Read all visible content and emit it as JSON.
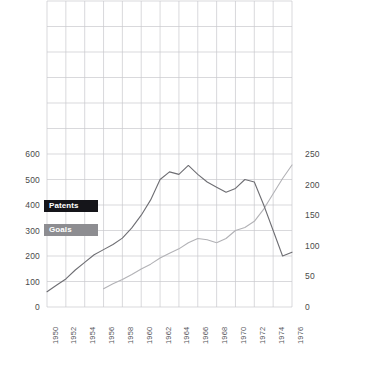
{
  "chart_data": {
    "type": "line",
    "title": "",
    "xlabel": "",
    "ylabel": "",
    "x": [
      1950,
      1951,
      1952,
      1953,
      1954,
      1955,
      1956,
      1957,
      1958,
      1959,
      1960,
      1961,
      1962,
      1963,
      1964,
      1965,
      1966,
      1967,
      1968,
      1969,
      1970,
      1971,
      1972,
      1973,
      1974,
      1975,
      1976
    ],
    "x_tick_labels": [
      "1950",
      "1952",
      "1954",
      "1956",
      "1958",
      "1960",
      "1962",
      "1964",
      "1966",
      "1968",
      "1970",
      "1972",
      "1974",
      "1976"
    ],
    "left_axis": {
      "ticks": [
        0,
        100,
        200,
        300,
        400,
        500,
        600
      ],
      "tick_labels": [
        "0",
        "100",
        "200",
        "300",
        "400",
        "500",
        "600"
      ],
      "ylim": [
        0,
        1200
      ],
      "label": ""
    },
    "right_axis": {
      "ticks": [
        0,
        50,
        100,
        150,
        200,
        250
      ],
      "tick_labels": [
        "0",
        "50",
        "100",
        "150",
        "200",
        "250"
      ],
      "ylim": [
        0,
        500
      ],
      "label": ""
    },
    "grid": true,
    "legend_position": "inside-left",
    "series": [
      {
        "name": "Patents",
        "axis": "left",
        "color": "#6e6e73",
        "values": [
          60,
          85,
          110,
          145,
          175,
          205,
          225,
          245,
          270,
          310,
          360,
          420,
          500,
          530,
          520,
          555,
          520,
          490,
          470,
          450,
          465,
          500,
          490,
          400,
          300,
          200,
          215
        ]
      },
      {
        "name": "Goals",
        "axis": "right",
        "color": "#b2b2b6",
        "values": [
          null,
          null,
          null,
          null,
          null,
          null,
          30,
          38,
          45,
          53,
          62,
          70,
          80,
          88,
          95,
          105,
          112,
          110,
          105,
          112,
          125,
          130,
          140,
          160,
          185,
          210,
          232
        ]
      }
    ]
  },
  "legend": {
    "items": [
      {
        "label": "Patents",
        "color": "#15151a"
      },
      {
        "label": "Goals",
        "color": "#8d8d91"
      }
    ]
  }
}
